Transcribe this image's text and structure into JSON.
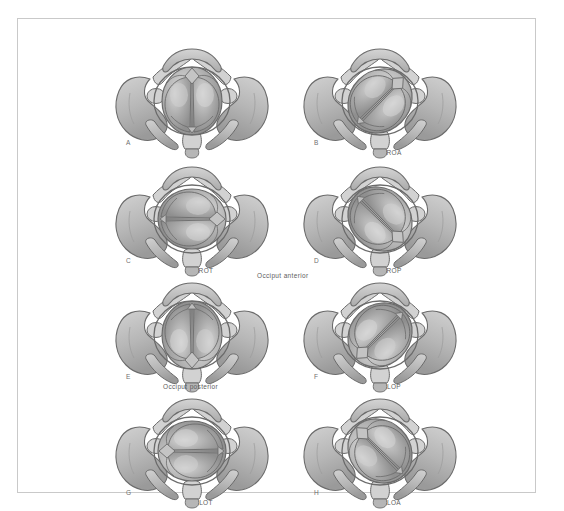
{
  "figure": {
    "border_color": "#c9c9c9",
    "background": "#ffffff",
    "bone_fill": "#b6b6b6",
    "bone_shadow": "#9a9a9a",
    "bone_light": "#d2d2d2",
    "head_fill": "#a8a8a8",
    "head_highlight": "#d8d8d8",
    "outline": "#6b6b6b",
    "text_color": "#5d5d5d"
  },
  "center_captions": [
    {
      "id": "occiput-anterior",
      "label": "Occiput anterior",
      "x": 239,
      "y": 253
    },
    {
      "id": "occiput-posterior",
      "label": "Occiput posterior",
      "x": 145,
      "y": 364
    }
  ],
  "panels": [
    {
      "id": "panel-a",
      "letter": "A",
      "caption": "",
      "position_code": "OA",
      "description": "Occiput anterior, sagittal suture vertical, occiput toward pubic symphysis",
      "head_rotation": 0,
      "x": 88,
      "y": 22,
      "letter_x": 20,
      "letter_y": 98,
      "caption_x": 100,
      "caption_y": 108
    },
    {
      "id": "panel-b",
      "letter": "B",
      "caption": "ROA",
      "position_code": "ROA",
      "description": "Right occiput anterior, occiput rotated 45 degrees to maternal right anterior",
      "head_rotation": 45,
      "x": 276,
      "y": 22,
      "letter_x": 20,
      "letter_y": 98,
      "caption_x": 100,
      "caption_y": 108
    },
    {
      "id": "panel-c",
      "letter": "C",
      "caption": "ROT",
      "position_code": "ROT",
      "description": "Right occiput transverse, sagittal suture horizontal, occiput at maternal right",
      "head_rotation": 90,
      "x": 88,
      "y": 140,
      "letter_x": 20,
      "letter_y": 98,
      "caption_x": 100,
      "caption_y": 108
    },
    {
      "id": "panel-d",
      "letter": "D",
      "caption": "ROP",
      "position_code": "ROP",
      "description": "Right occiput posterior, occiput rotated 135 degrees toward maternal right posterior",
      "head_rotation": 135,
      "x": 276,
      "y": 140,
      "letter_x": 20,
      "letter_y": 98,
      "caption_x": 100,
      "caption_y": 108
    },
    {
      "id": "panel-e",
      "letter": "E",
      "caption": "",
      "position_code": "OP",
      "description": "Occiput posterior, sagittal suture vertical, occiput toward sacrum",
      "head_rotation": 180,
      "x": 88,
      "y": 256,
      "letter_x": 20,
      "letter_y": 98,
      "caption_x": 100,
      "caption_y": 108
    },
    {
      "id": "panel-f",
      "letter": "F",
      "caption": "LOP",
      "position_code": "LOP",
      "description": "Left occiput posterior, occiput rotated toward maternal left posterior",
      "head_rotation": 225,
      "x": 276,
      "y": 256,
      "letter_x": 20,
      "letter_y": 98,
      "caption_x": 100,
      "caption_y": 108
    },
    {
      "id": "panel-g",
      "letter": "G",
      "caption": "LOT",
      "position_code": "LOT",
      "description": "Left occiput transverse, sagittal suture horizontal, occiput at maternal left",
      "head_rotation": 270,
      "x": 88,
      "y": 372,
      "letter_x": 20,
      "letter_y": 98,
      "caption_x": 100,
      "caption_y": 108
    },
    {
      "id": "panel-h",
      "letter": "H",
      "caption": "LOA",
      "position_code": "LOA",
      "description": "Left occiput anterior, occiput rotated toward maternal left anterior",
      "head_rotation": 315,
      "x": 276,
      "y": 372,
      "letter_x": 20,
      "letter_y": 98,
      "caption_x": 100,
      "caption_y": 108
    }
  ]
}
